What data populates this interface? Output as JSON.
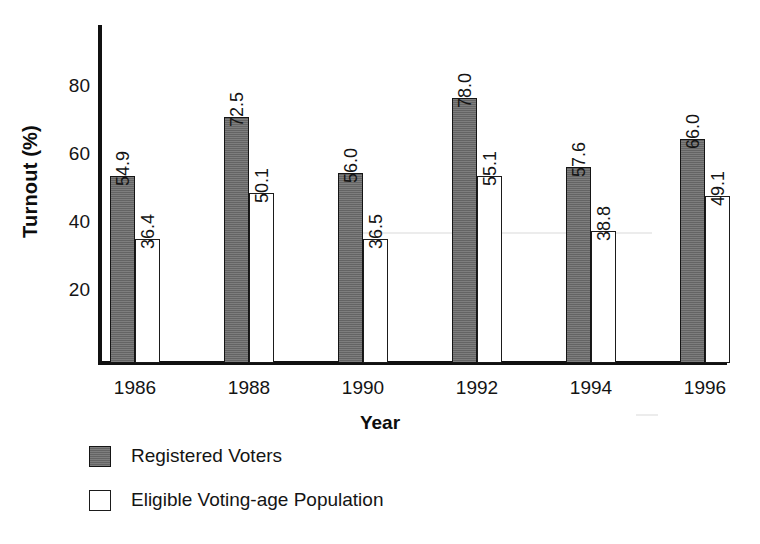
{
  "chart_data": {
    "type": "bar",
    "title": "",
    "xlabel": "Year",
    "ylabel": "Turnout (%)",
    "categories": [
      "1986",
      "1988",
      "1990",
      "1992",
      "1994",
      "1996"
    ],
    "series": [
      {
        "name": "Registered Voters",
        "swatch": "#6f6f6f",
        "values": [
          54.9,
          72.5,
          56.0,
          78.0,
          57.6,
          66.0
        ],
        "labels": [
          "54.9",
          "72.5",
          "56.0",
          "78.0",
          "57.6",
          "66.0"
        ]
      },
      {
        "name": "Eligible Voting-age Population",
        "swatch": "#ffffff",
        "values": [
          36.4,
          50.1,
          36.5,
          55.1,
          38.8,
          49.1
        ],
        "labels": [
          "36.4",
          "50.1",
          "36.5",
          "55.1",
          "38.8",
          "49.1"
        ]
      }
    ],
    "yticks": [
      20,
      40,
      60,
      80
    ],
    "ytick_labels": [
      "20",
      "40",
      "60",
      "80"
    ],
    "ylim": [
      0,
      100
    ],
    "grid": false,
    "legend_position": "bottom-left",
    "value_labels_rotated": true
  },
  "axes": {
    "y_axis_color": "#111111",
    "x_axis_color": "#111111"
  },
  "legend": {
    "entries": [
      {
        "label": "Registered Voters",
        "key": "registered"
      },
      {
        "label": "Eligible Voting-age Population",
        "key": "eligible"
      }
    ]
  }
}
